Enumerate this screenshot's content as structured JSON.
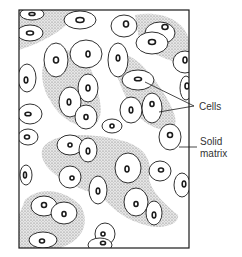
{
  "diagram": {
    "type": "histology-illustration",
    "labels": [
      {
        "id": "cells",
        "text": "Cells"
      },
      {
        "id": "solid_matrix",
        "line1": "Solid",
        "line2": "matrix"
      }
    ],
    "colors": {
      "outline": "#1a1a1a",
      "matrix_stipple": "#9a9a9a",
      "background": "#ffffff"
    }
  }
}
